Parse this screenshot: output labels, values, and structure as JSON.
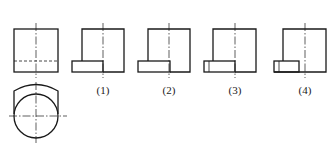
{
  "diagram": {
    "type": "orthographic-projection-exercise",
    "given_views": {
      "front_view": "square with vertical centerline and horizontal hidden (dashed) line near bottom",
      "top_view": "circle with crossing centerlines, flat-sided outline topped by arc"
    },
    "options": [
      {
        "label": "(1)",
        "description": "side view with protruding plain rectangle on left"
      },
      {
        "label": "(2)",
        "description": "side view with protruding rectangle, body starting mid-rectangle"
      },
      {
        "label": "(3)",
        "description": "side view with protruding rectangle containing one inner vertical line near left end"
      },
      {
        "label": "(4)",
        "description": "side view with short rectangle containing inner vertical line, body joined on left"
      }
    ],
    "colors": {
      "line": "#1a1a1a",
      "background": "#ffffff"
    }
  }
}
